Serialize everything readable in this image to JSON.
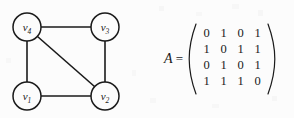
{
  "figure": {
    "background_color": "#fcfcfc",
    "ink_color": "#1a1a1a",
    "graph": {
      "title": "",
      "vertices": [
        {
          "id": "v4",
          "label": "v",
          "subscript": "4",
          "cx": 27,
          "cy": 27,
          "r": 14
        },
        {
          "id": "v3",
          "label": "v",
          "subscript": "3",
          "cx": 105,
          "cy": 27,
          "r": 14
        },
        {
          "id": "v1",
          "label": "v",
          "subscript": "1",
          "cx": 27,
          "cy": 96,
          "r": 14
        },
        {
          "id": "v2",
          "label": "v",
          "subscript": "2",
          "cx": 105,
          "cy": 96,
          "r": 14
        }
      ],
      "edges": [
        {
          "from": "v4",
          "to": "v3"
        },
        {
          "from": "v4",
          "to": "v1"
        },
        {
          "from": "v4",
          "to": "v2"
        },
        {
          "from": "v1",
          "to": "v2"
        },
        {
          "from": "v3",
          "to": "v2"
        }
      ]
    },
    "matrix": {
      "name": "A",
      "equals": "=",
      "bracket_style": "parentheses",
      "rows": [
        [
          "0",
          "1",
          "0",
          "1"
        ],
        [
          "1",
          "0",
          "1",
          "1"
        ],
        [
          "0",
          "1",
          "0",
          "1"
        ],
        [
          "1",
          "1",
          "1",
          "0"
        ]
      ]
    }
  }
}
